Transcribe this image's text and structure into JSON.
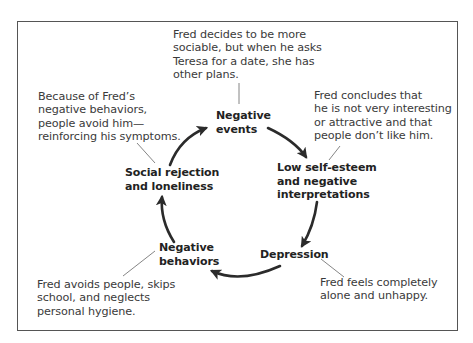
{
  "diagram": {
    "type": "cycle",
    "nodes": [
      {
        "id": "negative-events",
        "line1": "Negative",
        "line2": "events"
      },
      {
        "id": "low-self-esteem",
        "line1": "Low self-esteem",
        "line2": "and negative",
        "line3": "interpretations"
      },
      {
        "id": "depression",
        "line1": "Depression"
      },
      {
        "id": "negative-behaviors",
        "line1": "Negative",
        "line2": "behaviors"
      },
      {
        "id": "social-rejection",
        "line1": "Social rejection",
        "line2": "and loneliness"
      }
    ],
    "annotations": [
      {
        "target": "negative-events",
        "lines": [
          "Fred decides to be more",
          "sociable, but when he asks",
          "Teresa for a date, she has",
          "other plans."
        ]
      },
      {
        "target": "low-self-esteem",
        "lines": [
          "Fred concludes that",
          "he is not very interesting",
          "or attractive and that",
          "people don’t like him."
        ]
      },
      {
        "target": "depression",
        "lines": [
          "Fred feels completely",
          "alone and unhappy."
        ]
      },
      {
        "target": "negative-behaviors",
        "lines": [
          "Fred avoids people, skips",
          "school, and neglects",
          "personal hygiene."
        ]
      },
      {
        "target": "social-rejection",
        "lines": [
          "Because of Fred’s",
          "negative behaviors,",
          "people avoid him—",
          "reinforcing his symptoms."
        ]
      }
    ],
    "edges": [
      {
        "from": "negative-events",
        "to": "low-self-esteem"
      },
      {
        "from": "low-self-esteem",
        "to": "depression"
      },
      {
        "from": "depression",
        "to": "negative-behaviors"
      },
      {
        "from": "negative-behaviors",
        "to": "social-rejection"
      },
      {
        "from": "social-rejection",
        "to": "negative-events"
      }
    ],
    "colors": {
      "arrow": "#2b2b2b",
      "leader": "#777777",
      "frame": "#555555"
    }
  }
}
